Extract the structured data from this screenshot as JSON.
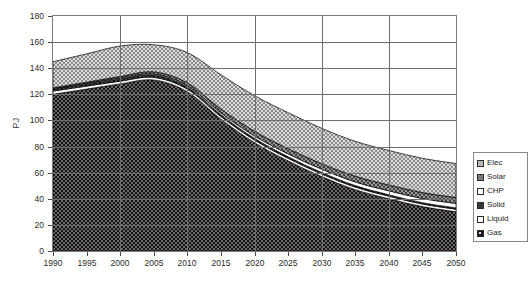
{
  "chart_data": {
    "type": "area",
    "title": "",
    "xlabel": "",
    "ylabel": "PJ",
    "stacked": true,
    "grid": true,
    "legend_position": "right",
    "xlim": [
      1990,
      2050
    ],
    "ylim": [
      0,
      180
    ],
    "ytick_values": [
      0,
      20,
      40,
      60,
      80,
      100,
      120,
      140,
      160,
      180
    ],
    "ytick_labels": [
      "0",
      "20",
      "40",
      "60",
      "80",
      "100",
      "120",
      "140",
      "160",
      "180"
    ],
    "xtick_values": [
      1990,
      1995,
      2000,
      2005,
      2010,
      2015,
      2020,
      2025,
      2030,
      2035,
      2040,
      2045,
      2050
    ],
    "xtick_labels": [
      "1990",
      "1995",
      "2000",
      "2005",
      "2010",
      "2015",
      "2020",
      "2025",
      "2030",
      "2035",
      "2040",
      "2045",
      "2050"
    ],
    "x": [
      1990,
      1995,
      2000,
      2005,
      2010,
      2015,
      2020,
      2025,
      2030,
      2035,
      2040,
      2045,
      2050
    ],
    "series": [
      {
        "name": "Gas",
        "color": "#1a1416",
        "values": [
          120,
          124,
          128,
          131,
          122,
          101,
          83,
          69,
          57,
          47,
          40,
          34,
          30
        ]
      },
      {
        "name": "Liquid",
        "color": "#fbfbfb",
        "values": [
          2.5,
          2.3,
          2.1,
          2.0,
          2.0,
          2.0,
          2.0,
          2.0,
          2.0,
          2.0,
          2.0,
          2.0,
          2.0
        ]
      },
      {
        "name": "Solid",
        "color": "#2a2a2a",
        "values": [
          1.5,
          1.6,
          1.7,
          1.8,
          1.6,
          1.4,
          1.3,
          1.2,
          1.2,
          1.1,
          1.1,
          1.0,
          1.0
        ]
      },
      {
        "name": "CHP",
        "color": "#ffffff",
        "values": [
          0.5,
          0.6,
          0.7,
          0.8,
          1.0,
          1.4,
          1.8,
          2.2,
          2.5,
          2.8,
          3.0,
          3.2,
          3.4
        ]
      },
      {
        "name": "Solar",
        "color": "#6e6e6e",
        "values": [
          0.5,
          0.8,
          1.2,
          1.6,
          2.2,
          3.0,
          3.6,
          4.0,
          4.2,
          4.4,
          4.5,
          4.6,
          4.6
        ]
      },
      {
        "name": "Elec",
        "color": "#d2d2d2",
        "values": [
          20,
          21.7,
          23.3,
          20.8,
          23.2,
          26.2,
          27.3,
          27.6,
          27.1,
          26.7,
          26.4,
          26.2,
          26.0
        ]
      }
    ],
    "totals": [
      145,
      151,
      157,
      158,
      152,
      135,
      119,
      106,
      94,
      84,
      77,
      71,
      67
    ]
  },
  "legend": {
    "items": [
      {
        "label": "Elec",
        "swatch": "elec"
      },
      {
        "label": "Solar",
        "swatch": "solar"
      },
      {
        "label": "CHP",
        "swatch": "chp"
      },
      {
        "label": "Solid",
        "swatch": "solid"
      },
      {
        "label": "Liquid",
        "swatch": "liquid"
      },
      {
        "label": "Gas",
        "swatch": "gas"
      }
    ]
  }
}
